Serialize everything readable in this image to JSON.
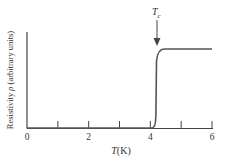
{
  "chart_data": {
    "type": "line",
    "title": "",
    "xlabel": "T(K)",
    "ylabel": "Resistivity ρ (arbitrary units)",
    "xlim": [
      0,
      6
    ],
    "ylim": [
      0,
      1.2
    ],
    "x_ticks": [
      0,
      1,
      2,
      3,
      4,
      5,
      6
    ],
    "x_tick_labels": [
      "0",
      "",
      "2",
      "",
      "4",
      "",
      "6"
    ],
    "grid": false,
    "annotations": [
      {
        "text": "Tc",
        "x": 4.2,
        "type": "arrow-down"
      }
    ],
    "series": [
      {
        "name": "resistivity",
        "x": [
          0,
          4.0,
          4.1,
          4.15,
          4.2,
          4.25,
          4.35,
          4.6,
          6.0
        ],
        "y": [
          0,
          0,
          0.01,
          0.05,
          0.5,
          0.88,
          0.97,
          1.0,
          1.0
        ]
      }
    ]
  }
}
